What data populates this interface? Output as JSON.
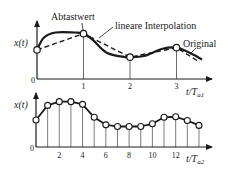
{
  "colors": {
    "ink": "#1a1a1a",
    "stem": "#444444",
    "marker_fill": "#ffffff"
  },
  "top_plot": {
    "ylabel": "x(t)",
    "xlabel_main": "t/T",
    "xlabel_sub": "a1",
    "origin_label": "0",
    "ticks": [
      "1",
      "2",
      "3"
    ],
    "annotations": {
      "sample": "Abtastwert",
      "interp": "lineare Interpolation",
      "original": "Original"
    }
  },
  "bottom_plot": {
    "ylabel": "x(t)",
    "xlabel_main": "t/T",
    "xlabel_sub": "a2",
    "origin_label": "0",
    "ticks": [
      "2",
      "4",
      "6",
      "8",
      "10",
      "12"
    ]
  },
  "chart_data": [
    {
      "type": "line",
      "title": "",
      "xlabel": "t/Ta1",
      "ylabel": "x(t)",
      "xlim": [
        0,
        3.6
      ],
      "ylim": [
        0,
        1
      ],
      "series": [
        {
          "name": "Original",
          "style": "solid",
          "x": [
            0,
            0.15,
            0.4,
            0.8,
            1.0,
            1.2,
            1.5,
            1.9,
            2.0,
            2.3,
            2.7,
            3.0,
            3.25,
            3.55
          ],
          "y": [
            0.52,
            0.74,
            0.83,
            0.83,
            0.81,
            0.7,
            0.47,
            0.39,
            0.39,
            0.41,
            0.54,
            0.56,
            0.48,
            0.35
          ]
        },
        {
          "name": "lineare Interpolation",
          "style": "dashed",
          "x": [
            0,
            1,
            2,
            3,
            3.5
          ],
          "y": [
            0.52,
            0.81,
            0.39,
            0.56,
            0.3
          ]
        },
        {
          "name": "Abtastwert",
          "style": "markers",
          "x": [
            0,
            1,
            2,
            3
          ],
          "y": [
            0.52,
            0.81,
            0.39,
            0.56
          ]
        }
      ]
    },
    {
      "type": "line",
      "title": "",
      "xlabel": "t/Ta2",
      "ylabel": "x(t)",
      "xlim": [
        0,
        15
      ],
      "ylim": [
        0,
        1
      ],
      "series": [
        {
          "name": "Abtastwerte",
          "style": "markers+line+stems",
          "x": [
            0,
            1,
            2,
            3,
            4,
            5,
            6,
            7,
            8,
            9,
            10,
            11,
            12,
            13,
            14
          ],
          "y": [
            0.5,
            0.77,
            0.84,
            0.84,
            0.79,
            0.55,
            0.41,
            0.38,
            0.38,
            0.38,
            0.43,
            0.55,
            0.56,
            0.49,
            0.4
          ]
        }
      ]
    }
  ]
}
